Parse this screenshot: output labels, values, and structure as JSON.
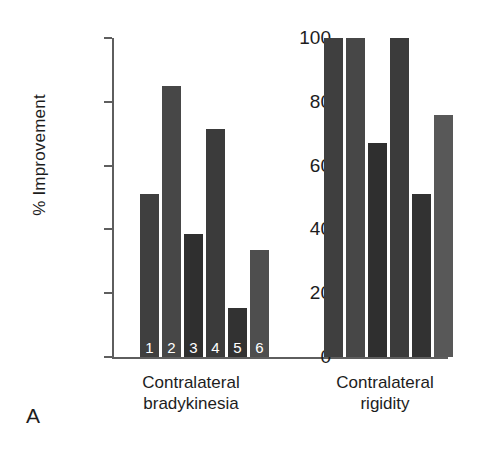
{
  "panel": {
    "label": "A"
  },
  "chart_data": {
    "type": "bar",
    "title": "",
    "xlabel": "",
    "ylabel": "% Improvement",
    "ylim": [
      0,
      100
    ],
    "yticks": [
      0,
      20,
      40,
      60,
      80,
      100
    ],
    "ytick_labels": [
      "0",
      "20",
      "40",
      "60",
      "80",
      "100"
    ],
    "grid": false,
    "legend": null,
    "bar_labels": [
      "1",
      "2",
      "3",
      "4",
      "5",
      "6"
    ],
    "categories": [
      "Contralateral bradykinesia",
      "Contralateral rigidity"
    ],
    "category_lines": [
      [
        "Contralateral",
        "bradykinesia"
      ],
      [
        "Contralateral",
        "rigidity"
      ]
    ],
    "groups": [
      {
        "name": "Contralateral bradykinesia",
        "subjects": [
          "1",
          "2",
          "3",
          "4",
          "5",
          "6"
        ],
        "values": [
          51,
          85,
          38.5,
          71.5,
          15.5,
          33.5
        ],
        "colors": [
          "#3f3f3f",
          "#474747",
          "#2f2f2f",
          "#3b3b3b",
          "#323232",
          "#4e4e4e"
        ]
      },
      {
        "name": "Contralateral rigidity",
        "subjects": [
          "1",
          "2",
          "3",
          "4",
          "5",
          "6"
        ],
        "values": [
          100,
          100,
          67,
          100,
          51,
          76
        ],
        "colors": [
          "#3f3f3f",
          "#474747",
          "#2f2f2f",
          "#3b3b3b",
          "#323232",
          "#585858"
        ]
      }
    ]
  }
}
